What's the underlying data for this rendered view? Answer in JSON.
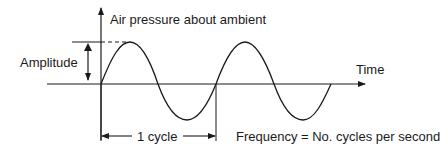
{
  "diagram": {
    "y_axis_label": "Air pressure about ambient",
    "x_axis_label": "Time",
    "amplitude_label": "Amplitude",
    "cycle_label": "1 cycle",
    "frequency_label": "Frequency = No. cycles per second",
    "wave": {
      "type": "sine",
      "cycles_shown": 2.0,
      "start_phase": "zero-crossing rising"
    },
    "colors": {
      "line": "#1a1a1a",
      "background": "#ffffff"
    }
  }
}
